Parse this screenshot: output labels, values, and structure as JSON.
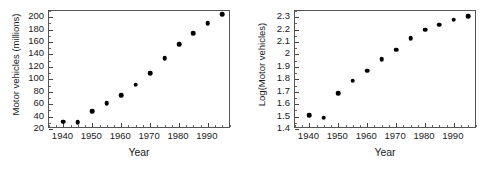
{
  "figure": {
    "background": "#ffffff",
    "point_color": "#000000",
    "axis_color": "#555555"
  },
  "chart_data": [
    {
      "type": "scatter",
      "panel": "left",
      "title": "",
      "xlabel": "Year",
      "ylabel": "Motor vehicles (millions)",
      "x": [
        1940,
        1945,
        1950,
        1955,
        1960,
        1965,
        1970,
        1975,
        1980,
        1985,
        1990,
        1995
      ],
      "values": [
        32,
        31,
        49,
        62,
        74,
        91,
        110,
        134,
        157,
        174,
        190,
        205
      ],
      "xlim": [
        1935,
        1998
      ],
      "ylim": [
        20,
        210
      ],
      "xticks": [
        1940,
        1950,
        1960,
        1970,
        1980,
        1990
      ],
      "xticklabels": [
        "1940",
        "1950",
        "1960",
        "1970",
        "1980",
        "1990"
      ],
      "yticks": [
        20,
        40,
        60,
        80,
        100,
        120,
        140,
        160,
        180,
        200
      ],
      "yticklabels": [
        "20",
        "40",
        "60",
        "80",
        "100",
        "120",
        "140",
        "160",
        "180",
        "200"
      ],
      "xminor_step": 2.5,
      "yminor_step": 10,
      "grid": false,
      "legend": null,
      "marker": "filled-circle"
    },
    {
      "type": "scatter",
      "panel": "right",
      "title": "",
      "xlabel": "Year",
      "ylabel": "Log(Motor vehicles)",
      "x": [
        1940,
        1945,
        1950,
        1955,
        1960,
        1965,
        1970,
        1975,
        1980,
        1985,
        1990,
        1995
      ],
      "values": [
        1.51,
        1.49,
        1.69,
        1.79,
        1.87,
        1.96,
        2.04,
        2.13,
        2.2,
        2.24,
        2.28,
        2.31
      ],
      "xlim": [
        1935,
        1998
      ],
      "ylim": [
        1.4,
        2.35
      ],
      "xticks": [
        1940,
        1950,
        1960,
        1970,
        1980,
        1990
      ],
      "xticklabels": [
        "1940",
        "1950",
        "1960",
        "1970",
        "1980",
        "1990"
      ],
      "yticks": [
        1.4,
        1.5,
        1.6,
        1.7,
        1.8,
        1.9,
        2.0,
        2.1,
        2.2,
        2.3
      ],
      "yticklabels": [
        "1.4",
        "1.5",
        "1.6",
        "1.7",
        "1.8",
        "1.9",
        "2",
        "2.1",
        "2.2",
        "2.3"
      ],
      "xminor_step": 2.5,
      "yminor_step": 0.05,
      "grid": false,
      "legend": null,
      "marker": "filled-circle"
    }
  ]
}
